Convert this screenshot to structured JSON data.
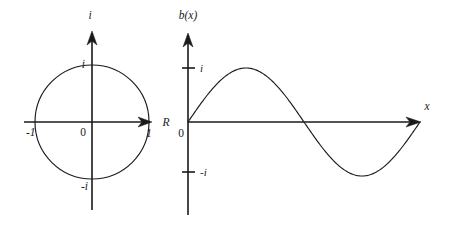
{
  "figure": {
    "title": "",
    "background_color": "#ffffff",
    "stroke_color": "#1a1a1a",
    "width": 456,
    "height": 227
  },
  "panels": [
    {
      "id": "complex-plane",
      "name": "unit-circle-complex-plane",
      "axes": {
        "horizontal": {
          "label": "R",
          "label_x": 166,
          "label_y": 126,
          "x1": 24,
          "x2": 152,
          "y": 122,
          "arrow": true
        },
        "vertical": {
          "label": "i",
          "label_x": 90,
          "label_y": 19,
          "x": 92,
          "y1": 210,
          "y2": 31,
          "arrow": true
        }
      },
      "origin": {
        "label": "0",
        "x": 83,
        "y": 136
      },
      "ticks": [
        {
          "label": "-1",
          "x": 26,
          "y": 136,
          "anchor": "start"
        },
        {
          "label": "1",
          "x": 146,
          "y": 137,
          "anchor": "start"
        },
        {
          "label": "i",
          "x": 83,
          "y": 68,
          "anchor": "end"
        },
        {
          "label": "-i",
          "x": 88,
          "y": 189,
          "anchor": "end"
        }
      ],
      "circle": {
        "cx": 92,
        "cy": 122,
        "r": 57
      }
    },
    {
      "id": "sine-plot",
      "name": "sine-wave-plot",
      "axes": {
        "horizontal": {
          "label": "x",
          "label_x": 426,
          "label_y": 110,
          "x1": 188,
          "x2": 420,
          "y": 122,
          "arrow": true
        },
        "vertical": {
          "label": "b(x)",
          "label_x": 188,
          "label_y": 19,
          "x": 188,
          "y1": 215,
          "y2": 33,
          "arrow": true
        }
      },
      "origin": {
        "label": "0",
        "x": 180,
        "y": 137
      },
      "ticks": [
        {
          "label": "i",
          "x": 200,
          "y": 72,
          "tick_y": 68,
          "anchor": "start"
        },
        {
          "label": "-i",
          "x": 200,
          "y": 176,
          "tick_y": 172,
          "anchor": "start"
        }
      ],
      "curve": {
        "type": "sine",
        "amplitude_px": 54,
        "baseline_y": 122,
        "x_start": 188,
        "x_end": 420,
        "periods": 1,
        "description": "one full period of sin(x) starting at origin rising to peak then trough"
      }
    }
  ],
  "chart_data": {
    "type": "line",
    "title": "",
    "xlabel": "x",
    "ylabel": "b(x)",
    "series": [
      {
        "name": "b(x) = sin(x)",
        "x": [
          0,
          0.3927,
          0.7854,
          1.1781,
          1.5708,
          1.9635,
          2.3562,
          2.7489,
          3.1416,
          3.5343,
          3.927,
          4.3197,
          4.7124,
          5.1051,
          5.4978,
          5.8905,
          6.2832
        ],
        "y": [
          0,
          0.3827,
          0.7071,
          0.9239,
          1,
          0.9239,
          0.7071,
          0.3827,
          0,
          -0.3827,
          -0.7071,
          -0.9239,
          -1,
          -0.9239,
          -0.7071,
          -0.3827,
          0
        ]
      }
    ],
    "ytick_labels": [
      "i",
      "-i"
    ],
    "ytick_values": [
      1,
      -1
    ],
    "ylim": [
      -1.15,
      1.15
    ],
    "xlim": [
      0,
      6.2832
    ],
    "grid": false,
    "legend": false
  }
}
